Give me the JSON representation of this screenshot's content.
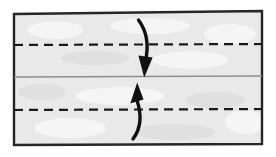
{
  "figure": {
    "kind": "origami-fold-diagram",
    "background_color": "#ffffff",
    "paper": {
      "name": "rectangular-sheet",
      "fill_color": "#e9e9e9",
      "outline_color": "#262626",
      "outline_width": 2.4,
      "corners": {
        "top_left": [
          14,
          14
        ],
        "top_right": [
          262,
          11
        ],
        "bottom_right": [
          262,
          144
        ],
        "bottom_left": [
          14,
          145
        ]
      }
    },
    "creases": [
      {
        "name": "upper-crease-line",
        "style": "dashed",
        "meaning": "valley fold line",
        "color": "#1a1a1a",
        "width": 2.2,
        "dash_pattern": "9 6",
        "x1": 14,
        "y1": 45,
        "x2": 262,
        "y2": 44
      },
      {
        "name": "center-line",
        "style": "solid",
        "meaning": "existing crease / centre line",
        "color": "#8d8d8d",
        "width": 1.3,
        "x1": 14,
        "y1": 77,
        "x2": 262,
        "y2": 76
      },
      {
        "name": "lower-crease-line",
        "style": "dashed",
        "meaning": "valley fold line",
        "color": "#1a1a1a",
        "width": 2.2,
        "dash_pattern": "9 6",
        "x1": 14,
        "y1": 110,
        "x2": 262,
        "y2": 109
      }
    ],
    "arrows": [
      {
        "name": "fold-down-arrow",
        "direction": "down",
        "meaning": "fold top edge down to centre",
        "color": "#111111",
        "tail": [
          139,
          20
        ],
        "tip": [
          144,
          76
        ]
      },
      {
        "name": "fold-up-arrow",
        "direction": "up",
        "meaning": "fold bottom edge up to centre",
        "color": "#111111",
        "tail": [
          133,
          139
        ],
        "tip": [
          137,
          83
        ]
      }
    ]
  }
}
